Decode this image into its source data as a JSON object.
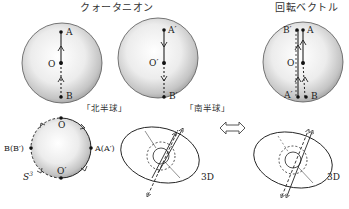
{
  "titles": {
    "quaternion": "クォータニオン",
    "rotation_vector": "回転ベクトル"
  },
  "spheres": {
    "north": {
      "caption": "「北半球」",
      "points": {
        "top": "A",
        "center": "O",
        "bottom": "B"
      }
    },
    "south": {
      "caption": "「南半球」",
      "points": {
        "top": "A′",
        "center": "O′",
        "bottom": "B′"
      }
    },
    "rotation": {
      "points": {
        "top_left": "B′",
        "top_right": "A",
        "center": "O",
        "bottom_left": "A′",
        "bottom_right": "B"
      }
    }
  },
  "circle_s3": {
    "label": "S",
    "superscript": "3",
    "points": {
      "top": "O",
      "bottom": "O′",
      "left": "B(B′)",
      "right": "A(A′)"
    }
  },
  "three_d": {
    "left_label": "3D",
    "right_label": "3D"
  },
  "equivalence_icon": "double-arrow-icon",
  "colors": {
    "sphere_light": "#f4f4f4",
    "sphere_dark": "#9a9a9a",
    "stroke": "#222222"
  }
}
